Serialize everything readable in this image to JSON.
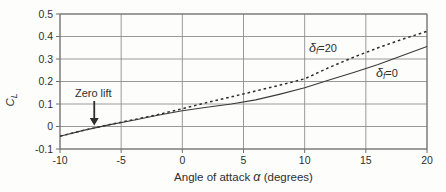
{
  "figure": {
    "background": "#fdfdfc",
    "text_color": "#2e2e2e",
    "grid_color": "#8f8f8f",
    "axis_color": "#6f6f6f",
    "curve_solid_color": "#3a3a3a",
    "curve_dashed_color": "#2c2c2c"
  },
  "chart_data": {
    "type": "line",
    "title": "",
    "xlabel_pre": "Angle of attack ",
    "xlabel_var": "α",
    "xlabel_post": " (degrees)",
    "ylabel_main": "C",
    "ylabel_sub": "L",
    "xlim": [
      -10,
      20
    ],
    "ylim": [
      -0.1,
      0.5
    ],
    "grid": true,
    "legend_position": "inline-labels",
    "x_ticks": [
      -10,
      -5,
      0,
      5,
      10,
      15,
      20
    ],
    "x_tick_labels": [
      "-10",
      "-5",
      "0",
      "5",
      "10",
      "15",
      "20"
    ],
    "y_ticks": [
      -0.1,
      0,
      0.1,
      0.2,
      0.3,
      0.4,
      0.5
    ],
    "y_tick_labels": [
      "-0.1",
      "0",
      "0.1",
      "0.2",
      "0.3",
      "0.4",
      "0.5"
    ],
    "x": [
      -10,
      -8,
      -6,
      -4,
      -2,
      0,
      2,
      4,
      6,
      8,
      10,
      12,
      14,
      16,
      18,
      20
    ],
    "series": [
      {
        "name": "flaps-20",
        "label_var": "δ",
        "label_sub": "f",
        "label_eq": "=20",
        "line_style": "dashed",
        "values": [
          -0.043,
          -0.016,
          0.008,
          0.03,
          0.053,
          0.079,
          0.106,
          0.132,
          0.158,
          0.184,
          0.212,
          0.262,
          0.308,
          0.35,
          0.388,
          0.423
        ]
      },
      {
        "name": "flaps-0",
        "label_var": "δ",
        "label_sub": "f",
        "label_eq": "=0",
        "line_style": "solid",
        "values": [
          -0.043,
          -0.016,
          0.007,
          0.028,
          0.05,
          0.07,
          0.086,
          0.1,
          0.118,
          0.144,
          0.172,
          0.206,
          0.24,
          0.276,
          0.315,
          0.355
        ]
      }
    ],
    "annotation": {
      "text": "Zero lift",
      "arrow_alpha": -7.2,
      "arrow_cl": 0.0
    }
  }
}
